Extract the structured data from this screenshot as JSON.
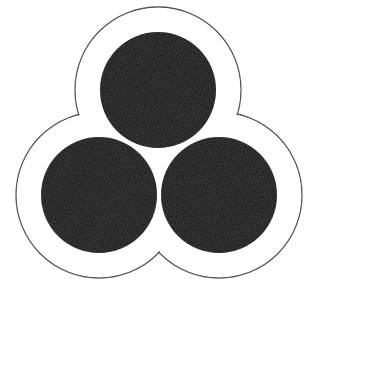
{
  "figure": {
    "description": "Trefoil emblem: three overlapping black circles surrounded by an offset outline",
    "colors": {
      "background": "#ffffff",
      "fill": "#111111",
      "outline": "#555555"
    },
    "circles": [
      {
        "name": "top",
        "cx": 158,
        "cy": 90,
        "r": 58
      },
      {
        "name": "bottom-left",
        "cx": 99,
        "cy": 195,
        "r": 58
      },
      {
        "name": "bottom-right",
        "cx": 219,
        "cy": 195,
        "r": 58
      }
    ],
    "outline": {
      "offset": 25,
      "stroke_width": 1.3
    }
  }
}
